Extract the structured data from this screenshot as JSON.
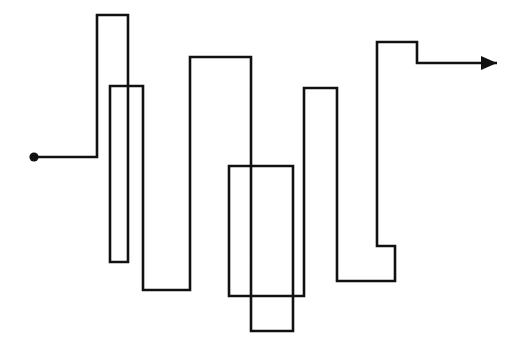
{
  "figure": {
    "title": "",
    "type": "orthogonal-polyline-diagram",
    "canvas": {
      "width": 522,
      "height": 358,
      "background": "#ffffff"
    },
    "stroke": {
      "color": "#111111",
      "width": 2.6,
      "linejoin": "miter",
      "linecap": "butt"
    },
    "start_marker": {
      "shape": "filled-circle",
      "cx": 34,
      "cy": 157,
      "r": 4.6,
      "color": "#111111"
    },
    "end_marker": {
      "shape": "solid-arrowhead",
      "x": 497,
      "y": 63,
      "direction": "right",
      "length": 16,
      "half_width": 7,
      "color": "#111111"
    },
    "path_points": [
      [
        34,
        157
      ],
      [
        97,
        157
      ],
      [
        97,
        15
      ],
      [
        128,
        15
      ],
      [
        128,
        262
      ],
      [
        110,
        262
      ],
      [
        110,
        86
      ],
      [
        143,
        86
      ],
      [
        143,
        290
      ],
      [
        190,
        290
      ],
      [
        190,
        57
      ],
      [
        251,
        57
      ],
      [
        251,
        331
      ],
      [
        293,
        331
      ],
      [
        293,
        166
      ],
      [
        229,
        166
      ],
      [
        229,
        296
      ],
      [
        304,
        296
      ],
      [
        304,
        88
      ],
      [
        337,
        88
      ],
      [
        337,
        281
      ],
      [
        395,
        281
      ],
      [
        395,
        246
      ],
      [
        377,
        246
      ],
      [
        377,
        42
      ],
      [
        417,
        42
      ],
      [
        417,
        63
      ],
      [
        497,
        63
      ]
    ],
    "path_d": "M34,157 L97,157 L97,15 L128,15 L128,262 L110,262 L110,86 L143,86 L143,290 L190,290 L190,57 L251,57 L251,331 L293,331 L293,166 L229,166 L229,296 L304,296 L304,88 L337,88 L337,281 L395,281 L395,246 L377,246 L377,42 L417,42 L417,63 L497,63",
    "arrow_points": "481,56 497,63 481,70",
    "segment_count": 27,
    "peaks": [
      {
        "label": "peak-1",
        "top_y": 15,
        "left_x": 97,
        "right_x": 128
      },
      {
        "label": "peak-2",
        "top_y": 86,
        "left_x": 110,
        "right_x": 143
      },
      {
        "label": "peak-3",
        "top_y": 57,
        "left_x": 190,
        "right_x": 251
      },
      {
        "label": "peak-4",
        "top_y": 166,
        "left_x": 229,
        "right_x": 293
      },
      {
        "label": "peak-5",
        "top_y": 88,
        "left_x": 304,
        "right_x": 337
      },
      {
        "label": "peak-6",
        "top_y": 42,
        "left_x": 377,
        "right_x": 417
      }
    ],
    "valleys": [
      {
        "label": "valley-1",
        "bottom_y": 262,
        "left_x": 110,
        "right_x": 128
      },
      {
        "label": "valley-2",
        "bottom_y": 290,
        "left_x": 143,
        "right_x": 190
      },
      {
        "label": "valley-3",
        "bottom_y": 331,
        "left_x": 251,
        "right_x": 293
      },
      {
        "label": "valley-4",
        "bottom_y": 296,
        "left_x": 229,
        "right_x": 304
      },
      {
        "label": "valley-5",
        "bottom_y": 281,
        "left_x": 337,
        "right_x": 395
      },
      {
        "label": "valley-6",
        "bottom_y": 246,
        "left_x": 377,
        "right_x": 395
      }
    ]
  }
}
